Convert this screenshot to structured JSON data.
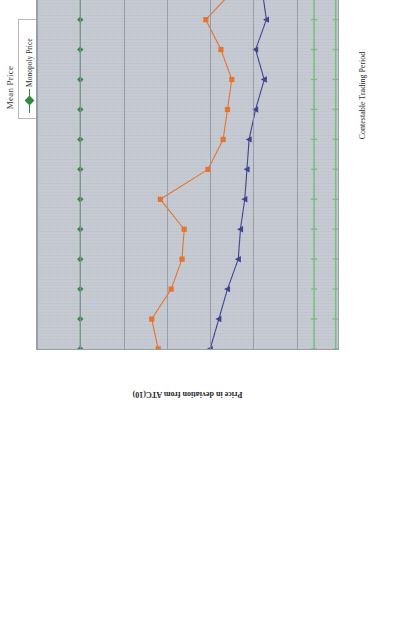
{
  "chart_data": {
    "type": "line",
    "title": "Mean Price",
    "xlabel": "Contestable Trading Period",
    "ylabel": "Price in deviation from ATC(10)",
    "x": [
      1,
      2,
      3,
      4,
      5,
      6,
      7,
      8,
      9,
      10,
      11,
      12,
      13,
      14,
      15,
      16,
      17,
      18
    ],
    "xticklabels": [
      "1",
      "2",
      "3",
      "4",
      "5",
      "6",
      "7",
      "8",
      "9",
      "10",
      "11",
      "12",
      "13",
      "14",
      "15",
      "16",
      "17",
      "18"
    ],
    "yticklabels": [
      "$1.40",
      "$1.20",
      "$1.00",
      "$0.80",
      "$0.60",
      "$0.40",
      "$0.20",
      "$-"
    ],
    "ytickvalues": [
      1.4,
      1.2,
      1.0,
      0.8,
      0.6,
      0.4,
      0.2,
      0.0
    ],
    "ylim": [
      0.0,
      1.4
    ],
    "xlim": [
      1,
      18
    ],
    "grid": true,
    "legend_position": "top-right",
    "series": [
      {
        "name": "Monopoly Price",
        "color": "#2e8b3d",
        "marker": "diamond",
        "values": [
          1.2,
          1.2,
          1.2,
          1.2,
          1.2,
          1.2,
          1.2,
          1.2,
          1.2,
          1.2,
          1.2,
          1.2,
          1.2,
          1.2,
          1.2,
          1.2,
          1.2,
          1.2
        ]
      },
      {
        "name": "Simulated Buyers",
        "color": "#e8702a",
        "marker": "square",
        "values": [
          0.84,
          0.87,
          0.78,
          0.73,
          0.72,
          0.83,
          0.61,
          0.54,
          0.52,
          0.5,
          0.55,
          0.62,
          0.49,
          0.5,
          0.47,
          0.45,
          0.4,
          0.38
        ]
      },
      {
        "name": "Human Subject Buyers",
        "color": "#3b3f8f",
        "marker": "triangle",
        "values": [
          0.6,
          0.56,
          0.52,
          0.47,
          0.46,
          0.44,
          0.43,
          0.42,
          0.39,
          0.35,
          0.39,
          0.34,
          0.36,
          0.34,
          0.31,
          0.33,
          0.29,
          0.28
        ]
      },
      {
        "name": "Efficient Price",
        "color": "#6fbf73",
        "marker": "line",
        "values": [
          0.12,
          0.12,
          0.12,
          0.12,
          0.12,
          0.12,
          0.12,
          0.12,
          0.12,
          0.12,
          0.12,
          0.12,
          0.12,
          0.12,
          0.12,
          0.12,
          0.12,
          0.12
        ]
      },
      {
        "name": "Range",
        "color": "#6fbf73",
        "marker": "line",
        "values": [
          0.02,
          0.02,
          0.02,
          0.02,
          0.02,
          0.02,
          0.02,
          0.02,
          0.02,
          0.02,
          0.02,
          0.02,
          0.02,
          0.02,
          0.02,
          0.02,
          0.02,
          0.02
        ]
      }
    ]
  },
  "legend": {
    "items": [
      {
        "label": "Monopoly Price"
      },
      {
        "label": "Simulated Buyers"
      },
      {
        "label": "Human Subject Buyers"
      },
      {
        "label": "Efficient Price"
      },
      {
        "label": "Range"
      }
    ]
  }
}
